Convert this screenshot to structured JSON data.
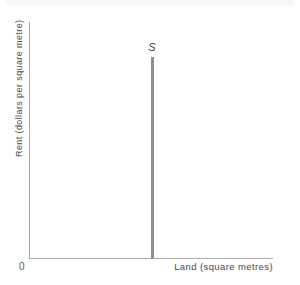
{
  "figure": {
    "origin_label": "0",
    "x_axis_label": "Land (square metres)",
    "y_axis_label": "Rent (dollars per square metre)",
    "supply_curve_label": "S"
  },
  "chart_data": {
    "type": "line",
    "title": "",
    "xlabel": "Land (square metres)",
    "ylabel": "Rent (dollars per square metre)",
    "x_tick_labels": [
      "0"
    ],
    "y_tick_labels": [],
    "grid": false,
    "legend_position": "none",
    "series": [
      {
        "name": "S",
        "description": "Perfectly inelastic (vertical) supply curve of land: fixed quantity supplied at every rent level",
        "shape": "vertical-line",
        "x_fraction_of_axis": 0.5,
        "y_fraction_span": [
          0.0,
          0.85
        ]
      }
    ],
    "colors": {
      "curve": "#8f8f8f",
      "axis": "#ababab",
      "text": "#4a4a4a"
    }
  }
}
